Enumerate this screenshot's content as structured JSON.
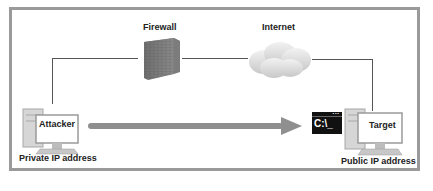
{
  "diagram": {
    "nodes": {
      "firewall": {
        "label": "Firewall"
      },
      "internet": {
        "label": "Internet"
      },
      "attacker": {
        "label": "Attacker",
        "caption": "Private IP address"
      },
      "target": {
        "label": "Target",
        "caption": "Public IP address"
      },
      "terminal": {
        "text": "C:\\_"
      }
    },
    "edges": [
      {
        "from": "attacker",
        "to": "firewall",
        "style": "thin line"
      },
      {
        "from": "firewall",
        "to": "internet",
        "style": "thin line"
      },
      {
        "from": "internet",
        "to": "target",
        "style": "thin line"
      },
      {
        "from": "attacker",
        "to": "terminal",
        "style": "thick gray arrow"
      }
    ],
    "colors": {
      "frame": "#9a9a9a",
      "wire": "#555555",
      "arrow": "#8f8f8f",
      "terminal_bg": "#111111"
    }
  }
}
